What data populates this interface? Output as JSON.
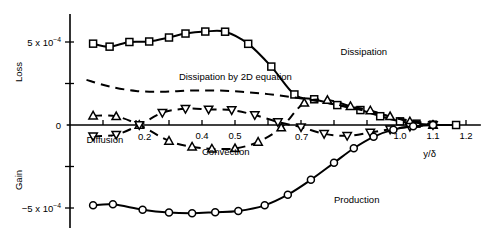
{
  "chart_data": {
    "type": "line",
    "title": "",
    "xlabel": "y/δ",
    "ylabel": "",
    "y_axis_annotations": {
      "upper_direction": "Loss",
      "lower_direction": "Gain",
      "top_tick_label": "5 x 10",
      "top_tick_exponent": "−4",
      "zero_tick_label": "0",
      "bottom_tick_label": "−5 x 10",
      "bottom_tick_exponent": "−4"
    },
    "xlim": [
      0.0,
      1.25
    ],
    "ylim": [
      -0.00065,
      0.00072
    ],
    "xticks": [
      0.1,
      0.2,
      0.3,
      0.4,
      0.5,
      0.6,
      0.7,
      0.8,
      0.9,
      1.0,
      1.1,
      1.2
    ],
    "xticklabels": [
      "",
      "0.2",
      "",
      "0.4",
      "0.5",
      "",
      "0.7",
      "",
      "",
      "1.0",
      "1.1",
      "1.2"
    ],
    "yticks": [
      0.0005,
      0.00025,
      0.0,
      -0.00025,
      -0.0005
    ],
    "yticklabels": [
      "5 x 10−4",
      "",
      "0",
      "",
      "−5 x 10−4"
    ],
    "grid": false,
    "legend_position": "inline-annotations",
    "series": [
      {
        "name": "Dissipation",
        "marker": "square",
        "linestyle": "solid",
        "label_text": "Dissipation",
        "x": [
          0.07,
          0.12,
          0.18,
          0.24,
          0.3,
          0.35,
          0.41,
          0.47,
          0.54,
          0.61,
          0.68,
          0.74,
          0.81,
          0.88,
          0.94,
          1.0,
          1.05,
          1.1,
          1.17
        ],
        "values": [
          0.00049,
          0.000472,
          0.0005,
          0.000503,
          0.000527,
          0.000551,
          0.000563,
          0.000562,
          0.000489,
          0.000352,
          0.000184,
          0.000155,
          0.00012,
          9e-05,
          5.3e-05,
          2.2e-05,
          8e-06,
          2e-06,
          0.0
        ]
      },
      {
        "name": "Dissipation by 2D equation",
        "marker": "none",
        "linestyle": "dashed",
        "label_text": "Dissipation by 2D equation",
        "x": [
          0.05,
          0.12,
          0.2,
          0.28,
          0.36,
          0.44,
          0.52,
          0.6,
          0.68,
          0.76,
          0.84,
          0.92,
          1.0,
          1.07,
          1.12
        ],
        "values": [
          0.000272,
          0.000232,
          0.000205,
          0.0002,
          0.000207,
          0.000208,
          0.0002,
          0.000186,
          0.000166,
          0.00014,
          0.00011,
          7.4e-05,
          3.8e-05,
          1.3e-05,
          0.0
        ]
      },
      {
        "name": "Convection",
        "marker": "triangle-up",
        "linestyle": "dashed",
        "label_text": "Convection",
        "x": [
          0.07,
          0.14,
          0.21,
          0.3,
          0.37,
          0.43,
          0.5,
          0.57,
          0.64,
          0.71,
          0.78,
          0.85,
          0.91,
          0.97,
          1.03,
          1.1
        ],
        "values": [
          5.6e-05,
          5.2e-05,
          0.0,
          -9.6e-05,
          -0.000131,
          -0.000143,
          -0.000141,
          -0.000102,
          -1.6e-05,
          0.000133,
          0.00015,
          0.000113,
          8.7e-05,
          5.2e-05,
          2.1e-05,
          0.0
        ]
      },
      {
        "name": "Diffusion",
        "marker": "triangle-down",
        "linestyle": "dashed",
        "label_text": "Diffusion",
        "x": [
          0.07,
          0.14,
          0.21,
          0.28,
          0.35,
          0.42,
          0.49,
          0.56,
          0.63,
          0.7,
          0.77,
          0.84,
          0.91,
          0.97,
          1.03,
          1.1
        ],
        "values": [
          -6.8e-05,
          -5.8e-05,
          0.0,
          7.4e-05,
          9.8e-05,
          9.4e-05,
          9e-05,
          6e-05,
          1.8e-05,
          -1.3e-05,
          -5.3e-05,
          -6.5e-05,
          -4.5e-05,
          -2.6e-05,
          -1e-05,
          0.0
        ]
      },
      {
        "name": "Production",
        "marker": "circle",
        "linestyle": "solid",
        "label_text": "Production",
        "x": [
          0.07,
          0.13,
          0.22,
          0.3,
          0.37,
          0.44,
          0.51,
          0.59,
          0.66,
          0.73,
          0.8,
          0.86,
          0.92,
          0.98,
          1.04,
          1.1
        ],
        "values": [
          -0.000484,
          -0.000478,
          -0.00051,
          -0.000527,
          -0.000531,
          -0.000525,
          -0.000518,
          -0.000484,
          -0.00042,
          -0.00033,
          -0.000228,
          -0.00014,
          -7.1e-05,
          -2.8e-05,
          -8e-06,
          0.0
        ]
      }
    ],
    "annotations": [
      {
        "text": "Dissipation",
        "x": 0.82,
        "y": 0.00042
      },
      {
        "text": "Dissipation by 2D equation",
        "x": 0.33,
        "y": 0.00027
      },
      {
        "text": "Convection",
        "x": 0.4,
        "y": -0.00018
      },
      {
        "text": "Diffusion",
        "x": 0.05,
        "y": -0.00011
      },
      {
        "text": "Production",
        "x": 0.8,
        "y": -0.00047
      }
    ]
  }
}
